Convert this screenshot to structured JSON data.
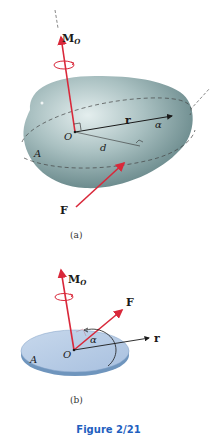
{
  "figure": {
    "caption": "Figure 2/21",
    "caption_color": "#1f5fbf",
    "panels": [
      {
        "id": "a",
        "label": "(a)",
        "labels": {
          "moment": "M",
          "moment_sub": "O",
          "origin": "O",
          "position_vector": "r",
          "angle": "α",
          "distance": "d",
          "area": "A",
          "force": "F"
        },
        "shape": "irregular-3d-body",
        "body_color": "#8fa9ab"
      },
      {
        "id": "b",
        "label": "(b)",
        "labels": {
          "moment": "M",
          "moment_sub": "O",
          "origin": "O",
          "position_vector": "r",
          "angle": "α",
          "area": "A",
          "force": "F"
        },
        "shape": "flat-disk",
        "body_color": "#b7cde6"
      }
    ],
    "colors": {
      "vector_red": "#d9283a",
      "vector_black": "#1a1a1a",
      "dashed_line": "#444444"
    }
  }
}
